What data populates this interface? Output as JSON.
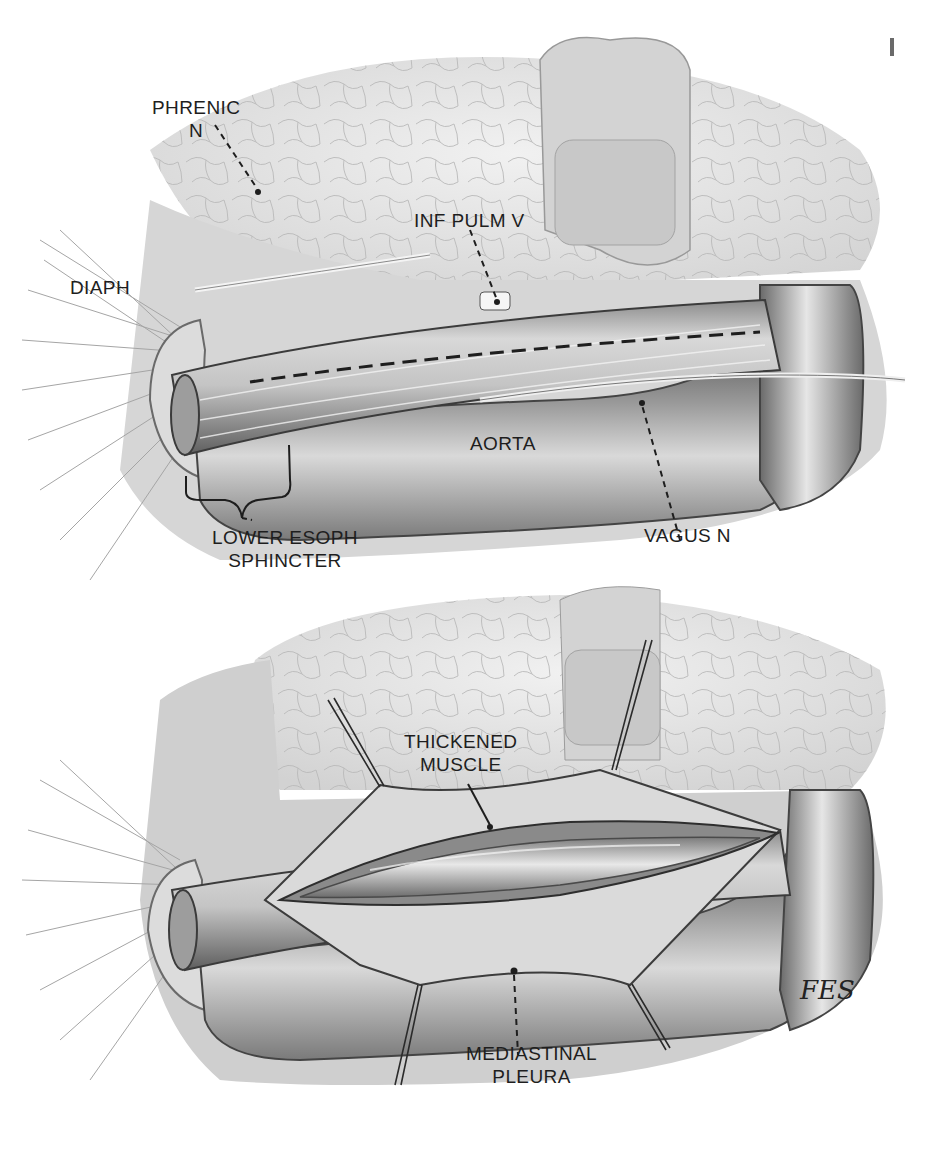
{
  "figure": {
    "type": "surgical anatomy illustration",
    "colors": {
      "background": "#ffffff",
      "ink": "#1e1e1e",
      "lung": "#e4e4e4",
      "tissue": "#bdbdbd",
      "shadow": "#6e6e6e"
    },
    "panels": [
      {
        "id": "top",
        "labels": {
          "phrenic": [
            "PHRENIC",
            "N"
          ],
          "inf_pulm_v": [
            "INF PULM V"
          ],
          "diaph": [
            "DIAPH"
          ],
          "aorta": [
            "AORTA"
          ],
          "lower_esoph_sphincter": [
            "LOWER ESOPH",
            "SPHINCTER"
          ],
          "vagus": [
            "VAGUS N"
          ]
        }
      },
      {
        "id": "bottom",
        "labels": {
          "thickened_muscle": [
            "THICKENED",
            "MUSCLE"
          ],
          "mediastinal_pleura": [
            "MEDIASTINAL",
            "PLEURA"
          ]
        },
        "signature": "FES"
      }
    ]
  }
}
